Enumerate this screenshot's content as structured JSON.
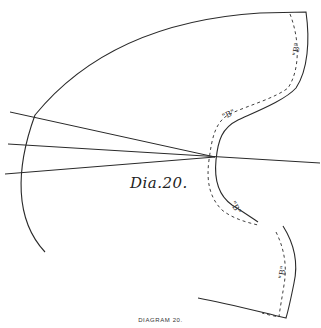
{
  "diagram": {
    "handwritten_label": "Dia.20.",
    "caption": "DIAGRAM 20.",
    "seam_labels": [
      "\"B\"",
      "\"B\"",
      "\"B\"",
      "\"B\""
    ],
    "colors": {
      "ink": "#2a2a2a",
      "background": "#ffffff"
    }
  }
}
